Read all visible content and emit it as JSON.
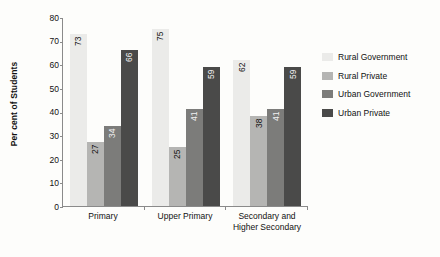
{
  "chart_data": {
    "type": "bar",
    "title": "",
    "subtitle": "",
    "xlabel": "",
    "ylabel": "Per cent of Students",
    "ylim": [
      0,
      80
    ],
    "yticks": [
      0,
      10,
      20,
      30,
      40,
      50,
      60,
      70,
      80
    ],
    "grid": false,
    "legend_position": "right",
    "categories": [
      "Primary",
      "Upper Primary",
      "Secondary and Higher Secondary"
    ],
    "category_lines": [
      [
        "Primary"
      ],
      [
        "Upper Primary"
      ],
      [
        "Secondary and",
        "Higher Secondary"
      ]
    ],
    "series": [
      {
        "name": "Rural Government",
        "color": "#ebebe9",
        "values": [
          73,
          75,
          62
        ]
      },
      {
        "name": "Rural Private",
        "color": "#b5b5b3",
        "values": [
          27,
          25,
          38
        ]
      },
      {
        "name": "Urban Government",
        "color": "#7c7c7a",
        "values": [
          34,
          41,
          41
        ]
      },
      {
        "name": "Urban Private",
        "color": "#4a4a49",
        "values": [
          66,
          59,
          59
        ]
      }
    ]
  },
  "legend": {
    "items": [
      {
        "label": "Rural Government"
      },
      {
        "label": "Rural Private"
      },
      {
        "label": "Urban Government"
      },
      {
        "label": "Urban Private"
      }
    ]
  }
}
